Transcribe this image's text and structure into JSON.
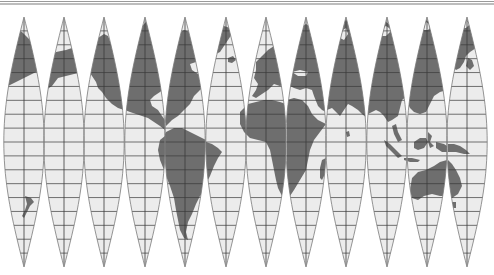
{
  "figure": {
    "projection": "globe gores (12 gores, 30° each)",
    "gore_count": 12,
    "graticule_interval_deg": 10,
    "colors": {
      "land": "#6e6e6e",
      "ocean": "#ececec",
      "graticule": "#3a3a3a",
      "gore_outline": "#7a7a7a",
      "border": "#9a9a9a"
    },
    "gores": [
      {
        "index": 1,
        "center_x": 24,
        "content": "North Pacific / Alaska tip, Hawaii"
      },
      {
        "index": 2,
        "center_x": 64,
        "content": "Alaska, North Pacific"
      },
      {
        "index": 3,
        "center_x": 104,
        "content": "Western North America, Pacific"
      },
      {
        "index": 4,
        "center_x": 145,
        "content": "Central North America, Central America, Pacific"
      },
      {
        "index": 5,
        "center_x": 185,
        "content": "Eastern North America, Greenland, South America"
      },
      {
        "index": 6,
        "center_x": 226,
        "content": "Greenland, Atlantic, Brazil"
      },
      {
        "index": 7,
        "center_x": 266,
        "content": "Europe, West Africa"
      },
      {
        "index": 8,
        "center_x": 306,
        "content": "Eastern Europe, Middle East, East Africa"
      },
      {
        "index": 9,
        "center_x": 346,
        "content": "Russia, India, Indian Ocean"
      },
      {
        "index": 10,
        "center_x": 387,
        "content": "Siberia, China, Southeast Asia"
      },
      {
        "index": 11,
        "center_x": 427,
        "content": "Eastern Asia, Indonesia, Australia"
      },
      {
        "index": 12,
        "center_x": 467,
        "content": "Kamchatka, Japan, New Guinea, Eastern Australia"
      }
    ]
  }
}
